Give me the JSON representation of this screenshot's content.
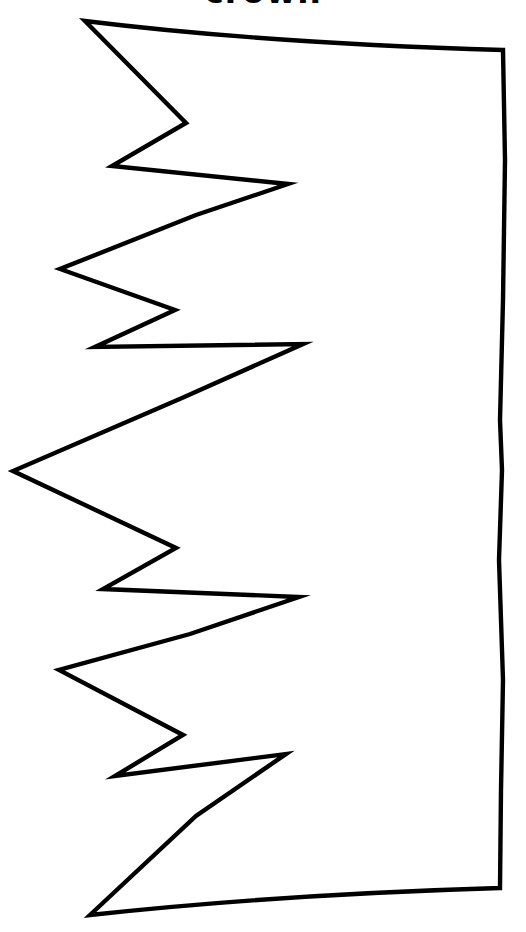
{
  "page": {
    "title": "crown",
    "background_color": "#ffffff",
    "width": 526,
    "height": 932
  },
  "artwork": {
    "name": "crown-template-outline",
    "description": "Hand-drawn printable crown template coloring outline, rotated 90 degrees so the zigzag crown points face left and the flat band edge is on the right",
    "type": "line-art",
    "stroke_color": "#000000",
    "fill_color": "#ffffff",
    "stroke_width": 4,
    "orientation": "rotated-90-points-left",
    "large_points": 4,
    "small_diamonds": 4,
    "geometry": {
      "top_tip": [
        85,
        21
      ],
      "top_right_corner": [
        503,
        50
      ],
      "bottom_right_corner": [
        500,
        888
      ],
      "bottom_tip": [
        90,
        915
      ],
      "main_point_tips": [
        [
          85,
          21
        ],
        [
          60,
          269
        ],
        [
          13,
          471
        ],
        [
          59,
          670
        ],
        [
          90,
          915
        ]
      ],
      "diamond_left_tips": [
        [
          112,
          166
        ],
        [
          95,
          347
        ],
        [
          103,
          589
        ],
        [
          115,
          776
        ]
      ],
      "diamond_right_tips": [
        [
          288,
          184
        ],
        [
          303,
          344
        ],
        [
          299,
          597
        ],
        [
          286,
          754
        ]
      ],
      "valley_joints": [
        [
          196,
          215
        ],
        [
          186,
          123
        ],
        [
          182,
          398
        ],
        [
          175,
          310
        ],
        [
          190,
          634
        ],
        [
          176,
          548
        ],
        [
          196,
          816
        ],
        [
          183,
          735
        ]
      ]
    }
  }
}
